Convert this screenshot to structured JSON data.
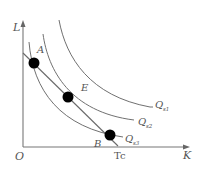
{
  "diagram": {
    "type": "isoquant-isocost",
    "axes": {
      "y_label": "L",
      "x_label": "K",
      "origin_label": "O",
      "x_marker_label": "Tc"
    },
    "isoquants": [
      {
        "id": "Qs1",
        "label_main": "Q",
        "label_sub": "s1",
        "position": "outer"
      },
      {
        "id": "Qs2",
        "label_main": "Q",
        "label_sub": "s2",
        "position": "middle"
      },
      {
        "id": "Qs3",
        "label_main": "Q",
        "label_sub": "s3",
        "position": "inner"
      }
    ],
    "points": [
      {
        "id": "A",
        "label": "A",
        "on": [
          "isocost",
          "Qs3"
        ]
      },
      {
        "id": "E",
        "label": "E",
        "on": [
          "isocost",
          "Qs2"
        ],
        "note": "tangency"
      },
      {
        "id": "B",
        "label": "B",
        "on": [
          "isocost",
          "Qs3"
        ]
      }
    ],
    "isocost_line": {
      "from": "L-axis",
      "to": "Tc"
    },
    "colors": {
      "lines": "#707070",
      "points": "#000000",
      "text": "#555555",
      "background": "#ffffff"
    }
  }
}
